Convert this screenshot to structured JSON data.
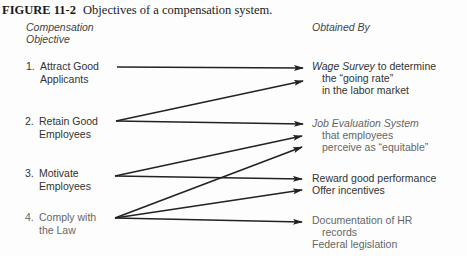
{
  "figure": {
    "label": "FIGURE 11-2",
    "caption": "Objectives of a compensation system."
  },
  "headers": {
    "left_line1": "Compensation",
    "left_line2": "Objective",
    "right": "Obtained By"
  },
  "objectives": [
    {
      "num": "1.",
      "line1": "Attract Good",
      "line2": "Applicants"
    },
    {
      "num": "2.",
      "line1": "Retain Good",
      "line2": "Employees"
    },
    {
      "num": "3.",
      "line1": "Motivate",
      "line2": "Employees"
    },
    {
      "num": "4.",
      "line1": "Comply with",
      "line2": "the Law"
    }
  ],
  "means": {
    "wage_survey": {
      "italic": "Wage Survey",
      "rest": " to determine",
      "line2": "the “going rate”",
      "line3": "in the labor market"
    },
    "job_eval": {
      "italic": "Job Evaluation System",
      "line2": "that employees",
      "line3": "perceive as “equitable”"
    },
    "reward": "Reward good performance",
    "incentives": "Offer incentives",
    "documentation": "Documentation of HR",
    "documentation_cont": "records",
    "legislation": "Federal legislation"
  },
  "connections": [
    {
      "from": "1",
      "to": "wage_survey"
    },
    {
      "from": "2",
      "to": "wage_survey"
    },
    {
      "from": "2",
      "to": "job_eval"
    },
    {
      "from": "3",
      "to": "job_eval"
    },
    {
      "from": "3",
      "to": "reward"
    },
    {
      "from": "4",
      "to": "job_eval"
    },
    {
      "from": "4",
      "to": "incentives"
    },
    {
      "from": "4",
      "to": "documentation"
    }
  ]
}
